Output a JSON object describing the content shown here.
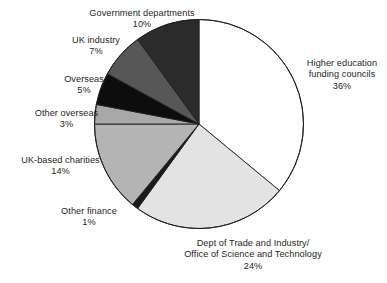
{
  "chart_data": {
    "type": "pie",
    "title": "",
    "subtitle": "",
    "xlabel": "",
    "ylabel": "",
    "legend_position": "none",
    "grid": false,
    "units": "percent",
    "start_angle_deg": 0,
    "direction": "clockwise",
    "categories": [
      "Higher education funding councils",
      "Dept of Trade and Industry/ Office of Science and Technology",
      "Other finance",
      "UK-based charities",
      "Other overseas",
      "Overseas",
      "UK industry",
      "Government departments"
    ],
    "values": [
      36,
      24,
      1,
      14,
      3,
      5,
      7,
      10
    ],
    "slices": [
      {
        "key": "higher-education",
        "label_line1": "Higher education",
        "label_line2": "funding councils",
        "percent_text": "36%",
        "value": 36,
        "color": "#ffffff"
      },
      {
        "key": "dti-ost",
        "label_line1": "Dept of Trade and Industry/",
        "label_line2": "Office of Science and Technology",
        "percent_text": "24%",
        "value": 24,
        "color": "#e3e3e3"
      },
      {
        "key": "other-finance",
        "label_line1": "Other finance",
        "label_line2": "",
        "percent_text": "1%",
        "value": 1,
        "color": "#1a1a1a"
      },
      {
        "key": "uk-based-charities",
        "label_line1": "UK-based charities",
        "label_line2": "",
        "percent_text": "14%",
        "value": 14,
        "color": "#b4b4b4"
      },
      {
        "key": "other-overseas",
        "label_line1": "Other overseas",
        "label_line2": "",
        "percent_text": "3%",
        "value": 3,
        "color": "#a8a8a8"
      },
      {
        "key": "overseas",
        "label_line1": "Overseas",
        "label_line2": "",
        "percent_text": "5%",
        "value": 5,
        "color": "#0d0d0d"
      },
      {
        "key": "uk-industry",
        "label_line1": "UK industry",
        "label_line2": "",
        "percent_text": "7%",
        "value": 7,
        "color": "#575757"
      },
      {
        "key": "government-departments",
        "label_line1": "Government departments",
        "label_line2": "",
        "percent_text": "10%",
        "value": 10,
        "color": "#2b2b2b"
      }
    ]
  },
  "labels": {
    "government": {
      "name": "Government departments",
      "pct": "10%"
    },
    "ukindustry": {
      "name": "UK industry",
      "pct": "7%"
    },
    "overseas": {
      "name": "Overseas",
      "pct": "5%"
    },
    "otheroverseas": {
      "name": "Other overseas",
      "pct": "3%"
    },
    "ukcharities": {
      "name": "UK-based charities",
      "pct": "14%"
    },
    "otherfinance": {
      "name": "Other finance",
      "pct": "1%"
    },
    "dti": {
      "name1": "Dept of Trade and Industry/",
      "name2": "Office of Science and Technology",
      "pct": "24%"
    },
    "highered": {
      "name1": "Higher education",
      "name2": "funding councils",
      "pct": "36%"
    }
  },
  "colors": {
    "outline": "#231f20",
    "background": "#ffffff",
    "text": "#231f20"
  }
}
